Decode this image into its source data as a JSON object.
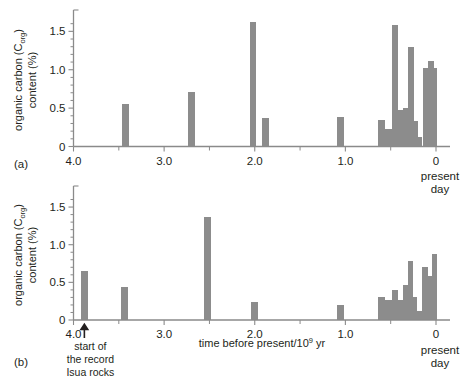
{
  "figure": {
    "background": "#ffffff",
    "bar_color": "#8c8c8c",
    "axis_color": "#8a8a8a",
    "text_color": "#231f20"
  },
  "labels": {
    "panel_a": "(a)",
    "panel_b": "(b)",
    "y_axis_line1": "organic carbon (C",
    "y_axis_sub": "org",
    "y_axis_line1_close": ")",
    "y_axis_line2": "content (%)",
    "x_axis_title_pre": "time before present/10",
    "x_axis_title_sup": "9",
    "x_axis_title_post": " yr",
    "present_day_line1": "present",
    "present_day_line2": "day",
    "annotation_line1": "start of",
    "annotation_line2": "the record",
    "annotation_line3": "Isua rocks",
    "y_ticks": [
      "0",
      "0.5",
      "1.0",
      "1.5"
    ],
    "x_ticks": [
      "4.0",
      "3.0",
      "2.0",
      "1.0",
      "0"
    ]
  },
  "chart_data": [
    {
      "type": "bar",
      "panel": "(a)",
      "title": "",
      "xlabel": "time before present/10^9 yr",
      "ylabel": "organic carbon (Corg) content (%)",
      "xlim": [
        4.0,
        0.0
      ],
      "ylim": [
        0,
        1.7
      ],
      "x_reversed": true,
      "grid": false,
      "legend": "none",
      "yticks": [
        0,
        0.5,
        1.0,
        1.5
      ],
      "xticks": [
        4.0,
        3.0,
        2.0,
        1.0,
        0.0
      ],
      "bars": [
        {
          "x": 3.43,
          "width": 0.075,
          "value": 0.56
        },
        {
          "x": 2.7,
          "width": 0.075,
          "value": 0.71
        },
        {
          "x": 2.02,
          "width": 0.075,
          "value": 1.62
        },
        {
          "x": 1.88,
          "width": 0.075,
          "value": 0.37
        },
        {
          "x": 1.05,
          "width": 0.075,
          "value": 0.38
        },
        {
          "x": 0.6,
          "width": 0.075,
          "value": 0.35
        },
        {
          "x": 0.525,
          "width": 0.075,
          "value": 0.23
        },
        {
          "x": 0.455,
          "width": 0.065,
          "value": 1.58
        },
        {
          "x": 0.395,
          "width": 0.06,
          "value": 0.47
        },
        {
          "x": 0.335,
          "width": 0.06,
          "value": 0.5
        },
        {
          "x": 0.275,
          "width": 0.06,
          "value": 1.3
        },
        {
          "x": 0.225,
          "width": 0.05,
          "value": 0.33
        },
        {
          "x": 0.175,
          "width": 0.05,
          "value": 0.12
        },
        {
          "x": 0.115,
          "width": 0.06,
          "value": 1.02
        },
        {
          "x": 0.055,
          "width": 0.06,
          "value": 1.12
        },
        {
          "x": 0.0,
          "width": 0.055,
          "value": 1.02
        }
      ]
    },
    {
      "type": "bar",
      "panel": "(b)",
      "title": "",
      "xlabel": "time before present/10^9 yr",
      "ylabel": "organic carbon (Corg) content (%)",
      "xlim": [
        4.0,
        0.0
      ],
      "ylim": [
        0,
        1.7
      ],
      "x_reversed": true,
      "grid": false,
      "legend": "none",
      "yticks": [
        0,
        0.5,
        1.0,
        1.5
      ],
      "xticks": [
        4.0,
        3.0,
        2.0,
        1.0,
        0.0
      ],
      "bars": [
        {
          "x": 3.88,
          "width": 0.075,
          "value": 0.65
        },
        {
          "x": 3.44,
          "width": 0.075,
          "value": 0.44
        },
        {
          "x": 2.52,
          "width": 0.075,
          "value": 1.37
        },
        {
          "x": 2.0,
          "width": 0.075,
          "value": 0.24
        },
        {
          "x": 1.05,
          "width": 0.075,
          "value": 0.2
        },
        {
          "x": 0.6,
          "width": 0.075,
          "value": 0.3
        },
        {
          "x": 0.525,
          "width": 0.075,
          "value": 0.26
        },
        {
          "x": 0.455,
          "width": 0.065,
          "value": 0.4
        },
        {
          "x": 0.395,
          "width": 0.06,
          "value": 0.27
        },
        {
          "x": 0.335,
          "width": 0.06,
          "value": 0.46
        },
        {
          "x": 0.28,
          "width": 0.05,
          "value": 0.79
        },
        {
          "x": 0.23,
          "width": 0.05,
          "value": 0.3
        },
        {
          "x": 0.18,
          "width": 0.05,
          "value": 0.12
        },
        {
          "x": 0.12,
          "width": 0.06,
          "value": 0.71
        },
        {
          "x": 0.06,
          "width": 0.06,
          "value": 0.59
        },
        {
          "x": 0.005,
          "width": 0.055,
          "value": 0.88
        }
      ]
    }
  ],
  "annotation": {
    "arrow_x": 3.88,
    "panel": "(b)"
  }
}
